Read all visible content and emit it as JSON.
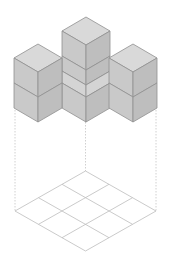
{
  "figure": {
    "cube_count": 7,
    "grid_size": "3x3",
    "colors": {
      "top_face": "#d9d9d9",
      "left_face": "#c9c9c9",
      "right_face": "#bebebe",
      "edge": "#8f8f8f",
      "grid_line": "#bdbdbd",
      "projection_line": "#c4c4c4"
    }
  }
}
